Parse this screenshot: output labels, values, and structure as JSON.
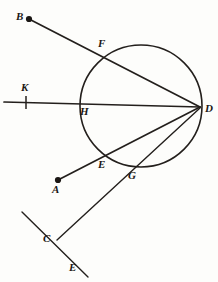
{
  "figure": {
    "canvas": {
      "width": 218,
      "height": 282
    },
    "ink_color": "#231f1c",
    "paper_color": "#fdfdfb",
    "circle": {
      "cx": 141,
      "cy": 106,
      "r": 61,
      "stroke_width": 1.6
    },
    "points": [
      {
        "id": "B",
        "label": "B",
        "x": 29,
        "y": 19,
        "dot": true,
        "label_x": 16,
        "label_y": 11
      },
      {
        "id": "F",
        "label": "F",
        "x": 104,
        "y": 55,
        "dot": false,
        "label_x": 98,
        "label_y": 38
      },
      {
        "id": "K",
        "label": "K",
        "x": 26,
        "y": 102,
        "dot": false,
        "label_x": 21,
        "label_y": 82
      },
      {
        "id": "H",
        "label": "H",
        "x": 81,
        "y": 104,
        "dot": false,
        "label_x": 80,
        "label_y": 106
      },
      {
        "id": "D",
        "label": "D",
        "x": 200,
        "y": 107,
        "dot": false,
        "label_x": 205,
        "label_y": 103
      },
      {
        "id": "E",
        "label": "E",
        "x": 100,
        "y": 158,
        "dot": false,
        "label_x": 98,
        "label_y": 159
      },
      {
        "id": "A",
        "label": "A",
        "x": 58,
        "y": 180,
        "dot": true,
        "label_x": 52,
        "label_y": 184
      },
      {
        "id": "G",
        "label": "G",
        "x": 128,
        "y": 169,
        "dot": false,
        "label_x": 128,
        "label_y": 170
      },
      {
        "id": "C",
        "label": "C",
        "x": 57,
        "y": 240,
        "dot": false,
        "label_x": 43,
        "label_y": 233
      },
      {
        "id": "E2",
        "label": "E",
        "x": 88,
        "y": 277,
        "dot": false,
        "label_x": 69,
        "label_y": 262
      }
    ],
    "segments": [
      {
        "id": "BD",
        "from": "B",
        "to": "D",
        "x1": 29,
        "y1": 19,
        "x2": 200,
        "y2": 107,
        "width": 1.7
      },
      {
        "id": "KD",
        "from": "K",
        "to": "D",
        "x1": 4,
        "y1": 102,
        "x2": 200,
        "y2": 107,
        "width": 1.7
      },
      {
        "id": "AD",
        "from": "A",
        "to": "D",
        "x1": 58,
        "y1": 180,
        "x2": 200,
        "y2": 107,
        "width": 1.7
      },
      {
        "id": "CD",
        "from": "C",
        "to": "D",
        "x1": 57,
        "y1": 240,
        "x2": 200,
        "y2": 108,
        "width": 1.4
      },
      {
        "id": "CE",
        "from": "C-upper",
        "to": "E-lower",
        "x1": 22,
        "y1": 212,
        "x2": 88,
        "y2": 277,
        "width": 1.4
      }
    ],
    "tick_mark": {
      "x": 26,
      "y1": 96,
      "y2": 109,
      "width": 1.5
    },
    "labels_order": [
      "B",
      "F",
      "K",
      "H",
      "D",
      "E",
      "A",
      "G",
      "C",
      "E2"
    ]
  }
}
